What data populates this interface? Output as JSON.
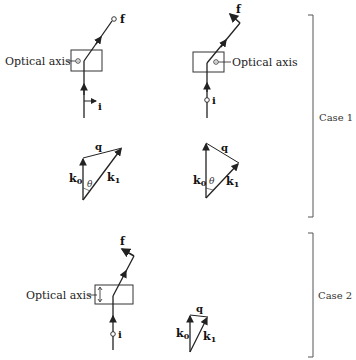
{
  "labels": {
    "optical_axis": "Optical axis",
    "incident": "i",
    "final": "f",
    "k0": "k",
    "k0_sub": "0",
    "k1": "k",
    "k1_sub": "1",
    "q": "q",
    "theta": "θ",
    "case1": "Case 1",
    "case2": "Case 2"
  },
  "panels": [
    {
      "name": "case1-left",
      "optical_axis_mark": "dot-in-circle",
      "incident_polarization": "arrow-right",
      "final_polarization": "circle"
    },
    {
      "name": "case1-right",
      "optical_axis_mark": "dot-in-circle",
      "incident_polarization": "circle",
      "final_polarization": "arrow"
    },
    {
      "name": "case2",
      "optical_axis_mark": "vertical-double-arrow",
      "incident_polarization": "circle",
      "final_polarization": "arrow"
    }
  ],
  "colors": {
    "line": "#2a2a2a",
    "bracket": "#555555",
    "box": "#333333"
  }
}
